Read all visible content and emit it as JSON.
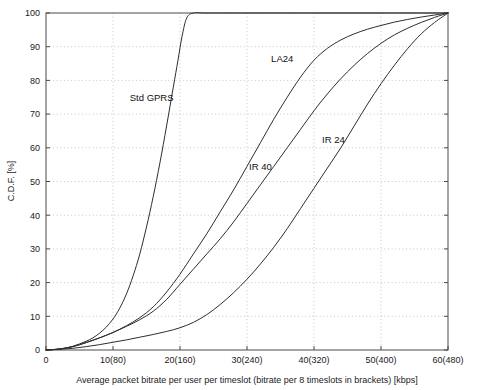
{
  "chart_data": {
    "type": "line",
    "title": "",
    "xlabel": "Average packet bitrate per user per timeslot (bitrate per 8 timeslots in brackets) [kbps]",
    "ylabel": "C.D.F. [%]",
    "xlim": [
      0,
      60
    ],
    "ylim": [
      0,
      100
    ],
    "grid": true,
    "legend_position": "inline-annotations",
    "xticks": [
      0,
      10,
      20,
      30,
      40,
      50,
      60
    ],
    "xticklabels": [
      "0",
      "10(80)",
      "20(160)",
      "30(240)",
      "40(320)",
      "50(400)",
      "60(480)"
    ],
    "yticks": [
      0,
      10,
      20,
      30,
      40,
      50,
      60,
      70,
      80,
      90,
      100
    ],
    "yticklabels": [
      "0",
      "10",
      "20",
      "30",
      "40",
      "50",
      "60",
      "70",
      "80",
      "90",
      "100"
    ],
    "series": [
      {
        "name": "Std GPRS",
        "label": "Std GPRS",
        "label_x": 12.5,
        "label_y": 74,
        "color": "#2e2e2e",
        "x": [
          0,
          1,
          2,
          3,
          4,
          5,
          6,
          7,
          8,
          9,
          10,
          11,
          12,
          13,
          14,
          15,
          16,
          17,
          18,
          19,
          19.7,
          20.3,
          21,
          22,
          24,
          30,
          40,
          50,
          60
        ],
        "y": [
          0,
          0.1,
          0.3,
          0.6,
          1.1,
          1.8,
          2.6,
          3.6,
          5.0,
          6.8,
          9.2,
          12.4,
          16.6,
          22.0,
          28.5,
          36.5,
          45.5,
          55.5,
          66.5,
          78.0,
          86.0,
          93.0,
          98.5,
          100,
          100,
          100,
          100,
          100,
          100
        ]
      },
      {
        "name": "LA24",
        "label": "LA24",
        "label_x": 33.6,
        "label_y": 85.5,
        "color": "#2e2e2e",
        "x": [
          0,
          2,
          4,
          6,
          8,
          10,
          12,
          14,
          16,
          18,
          20,
          22,
          24,
          26,
          28,
          30,
          32,
          34,
          36,
          38,
          40,
          42,
          44,
          46,
          48,
          50,
          52,
          54,
          56,
          58,
          60
        ],
        "y": [
          0,
          0.3,
          1.0,
          2.2,
          3.6,
          5.2,
          7.2,
          9.6,
          12.8,
          17.2,
          22.5,
          28.5,
          34.5,
          41.0,
          47.5,
          54.5,
          61.5,
          68.5,
          75.0,
          81.0,
          86.0,
          89.5,
          92.0,
          93.8,
          95.2,
          96.3,
          97.3,
          98.1,
          98.8,
          99.4,
          100
        ]
      },
      {
        "name": "IR 40",
        "label": "IR 40",
        "label_x": 30.3,
        "label_y": 53.5,
        "color": "#2e2e2e",
        "x": [
          0,
          2,
          4,
          6,
          8,
          10,
          12,
          14,
          16,
          18,
          20,
          22,
          24,
          26,
          28,
          30,
          32,
          34,
          36,
          38,
          40,
          42,
          44,
          46,
          48,
          50,
          52,
          54,
          56,
          58,
          60
        ],
        "y": [
          0,
          0.3,
          1.0,
          2.2,
          3.6,
          5.2,
          7.0,
          9.0,
          11.5,
          15.0,
          19.5,
          24.0,
          28.5,
          33.0,
          38.0,
          43.5,
          49.0,
          54.5,
          60.0,
          65.5,
          71.0,
          76.0,
          80.5,
          84.5,
          88.0,
          91.0,
          93.5,
          95.5,
          97.2,
          98.7,
          100
        ]
      },
      {
        "name": "IR 24",
        "label": "IR 24",
        "label_x": 41.2,
        "label_y": 61.5,
        "color": "#2e2e2e",
        "x": [
          0,
          2,
          4,
          6,
          8,
          10,
          12,
          14,
          16,
          18,
          20,
          22,
          24,
          26,
          28,
          30,
          32,
          34,
          36,
          38,
          40,
          42,
          44,
          46,
          48,
          50,
          52,
          54,
          56,
          58,
          60
        ],
        "y": [
          0,
          0.2,
          0.5,
          1.0,
          1.6,
          2.3,
          3.0,
          3.8,
          4.6,
          5.5,
          6.6,
          8.2,
          10.5,
          13.5,
          17.0,
          21.0,
          25.5,
          30.5,
          36.0,
          42.0,
          48.0,
          54.0,
          60.0,
          66.5,
          73.0,
          79.0,
          84.5,
          89.5,
          93.8,
          97.2,
          100
        ]
      }
    ]
  },
  "figure": {
    "background_color": "#ffffff",
    "axis_color": "#4a4a4a",
    "grid_color": "#b9b9b9",
    "curve_color": "#2e2e2e"
  }
}
